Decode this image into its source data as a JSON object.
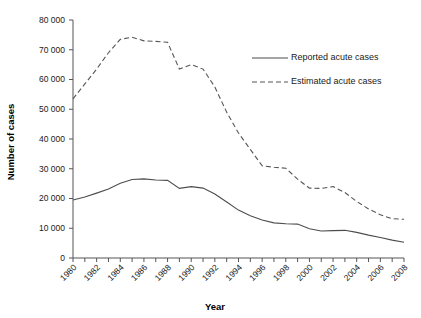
{
  "chart_data": {
    "type": "line",
    "title": "",
    "xlabel": "Year",
    "ylabel": "Number of cases",
    "xlim": [
      1980,
      2008
    ],
    "ylim": [
      0,
      80000
    ],
    "grid": false,
    "legend_position": "upper-right",
    "x": [
      1980,
      1981,
      1982,
      1983,
      1984,
      1985,
      1986,
      1987,
      1988,
      1989,
      1990,
      1991,
      1992,
      1993,
      1994,
      1995,
      1996,
      1997,
      1998,
      1999,
      2000,
      2001,
      2002,
      2003,
      2004,
      2005,
      2006,
      2007,
      2008
    ],
    "xtick_labels": [
      "1980",
      "1982",
      "1984",
      "1986",
      "1988",
      "1990",
      "1992",
      "1994",
      "1996",
      "1998",
      "2000",
      "2002",
      "2004",
      "2006",
      "2008"
    ],
    "xtick_values": [
      1980,
      1982,
      1984,
      1986,
      1988,
      1990,
      1992,
      1994,
      1996,
      1998,
      2000,
      2002,
      2004,
      2006,
      2008
    ],
    "ytick_labels": [
      "0",
      "10 000",
      "20 000",
      "30 000",
      "40 000",
      "50 000",
      "60 000",
      "70 000",
      "80 000"
    ],
    "ytick_values": [
      0,
      10000,
      20000,
      30000,
      40000,
      50000,
      60000,
      70000,
      80000
    ],
    "series": [
      {
        "name": "Reported acute cases",
        "style": "solid",
        "color": "#4d4d4d",
        "values": [
          19500,
          20500,
          21800,
          23200,
          25100,
          26400,
          26600,
          26200,
          26100,
          23400,
          24000,
          23500,
          21500,
          18800,
          16100,
          14200,
          12800,
          11800,
          11500,
          11400,
          9800,
          9100,
          9200,
          9300,
          8600,
          7700,
          6900,
          6000,
          5300
        ]
      },
      {
        "name": "Estimated acute cases",
        "style": "dashed",
        "color": "#555555",
        "values": [
          53500,
          58500,
          63500,
          69000,
          73500,
          74200,
          73000,
          72800,
          72500,
          63500,
          65000,
          63500,
          57500,
          49000,
          42000,
          36500,
          31000,
          30500,
          30200,
          26500,
          23500,
          23400,
          24000,
          22000,
          19000,
          16500,
          14500,
          13200,
          13000
        ]
      }
    ]
  },
  "legend": {
    "items": [
      {
        "label": "Reported acute cases"
      },
      {
        "label": "Estimated acute cases"
      }
    ]
  },
  "axes": {
    "x_title": "Year",
    "y_title": "Number of cases"
  }
}
